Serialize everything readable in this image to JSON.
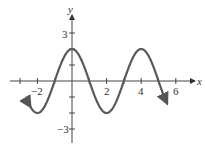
{
  "chart_data": {
    "type": "line",
    "title": "",
    "xlabel": "x",
    "ylabel": "y",
    "function": "y = 2cos(pi*x/2)",
    "xlim": [
      -3.5,
      7
    ],
    "ylim": [
      -3.5,
      4
    ],
    "x_ticks": [
      -3,
      -2,
      -1,
      0,
      1,
      2,
      3,
      4,
      5,
      6
    ],
    "x_tick_labels": [
      "-2",
      "2",
      "4",
      "6"
    ],
    "y_ticks": [
      -3,
      -2,
      -1,
      1,
      2,
      3
    ],
    "y_tick_labels": [
      "3",
      "-3"
    ],
    "series": [
      {
        "name": "curve",
        "x": [
          -2.4,
          -2,
          -1,
          0,
          1,
          2,
          3,
          4,
          5,
          5.5
        ],
        "values": [
          -1.62,
          -2,
          0,
          2,
          0,
          -2,
          0,
          2,
          0,
          -1.41
        ]
      }
    ],
    "color": "#555555",
    "grid": false,
    "legend": "none"
  },
  "labels": {
    "x_axis": "x",
    "y_axis": "y",
    "tick_neg2": "−2",
    "tick_2": "2",
    "tick_4": "4",
    "tick_6": "6",
    "tick_3": "3",
    "tick_neg3": "−3"
  }
}
